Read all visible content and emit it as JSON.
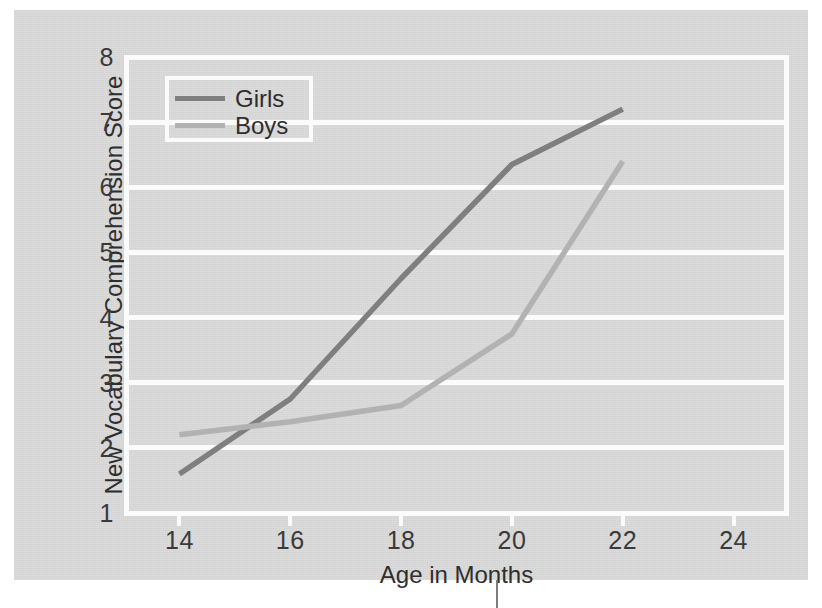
{
  "chart_data": {
    "type": "line",
    "title": "",
    "subtitle": "",
    "xlabel": "Age in Months",
    "ylabel": "New Vocabulary Comprehension Score",
    "x": [
      14,
      16,
      18,
      20,
      22
    ],
    "xticks": [
      14,
      16,
      18,
      20,
      22,
      24
    ],
    "yticks": [
      8,
      7,
      6,
      5,
      4,
      3,
      2,
      1
    ],
    "xlim": [
      13,
      25
    ],
    "ylim": [
      1,
      8
    ],
    "grid": "horizontal",
    "legend_position": "top-left",
    "series": [
      {
        "name": "Girls",
        "color": "#7f7f7f",
        "values": [
          1.6,
          2.75,
          4.6,
          6.35,
          7.2
        ]
      },
      {
        "name": "Boys",
        "color": "#b2b2b2",
        "values": [
          2.2,
          2.4,
          2.65,
          3.75,
          6.4
        ]
      }
    ],
    "annotations": []
  },
  "legend": {
    "entries": [
      {
        "label": "Girls",
        "color": "#7f7f7f"
      },
      {
        "label": "Boys",
        "color": "#b2b2b2"
      }
    ]
  },
  "colors": {
    "paper_background": "#d9d9d9",
    "gridline": "#fbfbfb",
    "girls_line": "#7f7f7f",
    "boys_line": "#b2b2b2",
    "text": "#2e2e2e"
  }
}
